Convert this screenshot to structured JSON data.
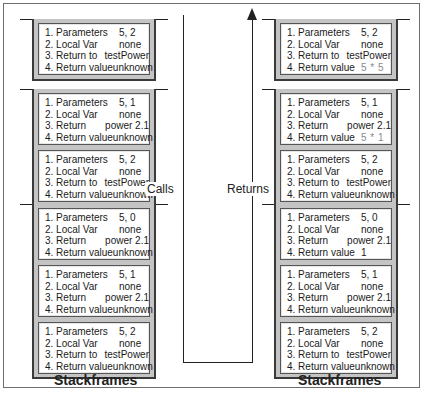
{
  "labels": {
    "calls": "Calls",
    "returns": "Returns",
    "left_title": "Stackframes",
    "right_title": "Stackframes"
  },
  "row_keys": {
    "params": "1. Parameters",
    "local": "2. Local  Var",
    "local_b": "2. Local Var",
    "return_to": "3. Return to",
    "return": "3. Return",
    "return_value": "4. Return value"
  },
  "left": {
    "stacks": [
      {
        "frames": [
          {
            "k": [
              "1. Parameters",
              "2. Local  Var",
              "3. Return to",
              "4. Return value"
            ],
            "v": [
              "5, 2",
              "none",
              "testPower",
              "unknown"
            ]
          }
        ]
      },
      {
        "frames": [
          {
            "k": [
              "1. Parameters",
              "2. Local Var",
              "3. Return",
              "4. Return value"
            ],
            "v": [
              "5, 1",
              "none",
              "power 2.1",
              "unknown"
            ]
          },
          {
            "k": [
              "1. Parameters",
              "2. Local  Var",
              "3. Return to",
              "4. Return value"
            ],
            "v": [
              "5, 2",
              "none",
              "testPower",
              "unknown"
            ]
          }
        ]
      },
      {
        "frames": [
          {
            "k": [
              "1. Parameters",
              "2. Local Var",
              "3. Return",
              "4. Return value"
            ],
            "v": [
              "5, 0",
              "none",
              "power 2.1",
              "unknown"
            ]
          },
          {
            "k": [
              "1. Parameters",
              "2. Local Var",
              "3. Return",
              "4. Return value"
            ],
            "v": [
              "5, 1",
              "none",
              "power 2.1",
              "unknown"
            ]
          },
          {
            "k": [
              "1. Parameters",
              "2. Local  Var",
              "3. Return to",
              "4. Return value"
            ],
            "v": [
              "5, 2",
              "none",
              "testPower",
              "unknown"
            ]
          }
        ]
      }
    ]
  },
  "right": {
    "stacks": [
      {
        "frames": [
          {
            "k": [
              "1. Parameters",
              "2. Local  Var",
              "3. Return to",
              "4. Return value"
            ],
            "v": [
              "5, 2",
              "none",
              "testPower",
              "5 * 5"
            ]
          }
        ]
      },
      {
        "frames": [
          {
            "k": [
              "1. Parameters",
              "2. Local Var",
              "3. Return",
              "4. Return value"
            ],
            "v": [
              "5, 1",
              "none",
              "power 2.1",
              "5 * 1"
            ]
          },
          {
            "k": [
              "1. Parameters",
              "2. Local  Var",
              "3. Return to",
              "4. Return value"
            ],
            "v": [
              "5, 2",
              "none",
              "testPower",
              "unknown"
            ]
          }
        ]
      },
      {
        "frames": [
          {
            "k": [
              "1. Parameters",
              "2. Local Var",
              "3. Return",
              "4. Return value"
            ],
            "v": [
              "5, 0",
              "none",
              "power 2.1",
              "1"
            ]
          },
          {
            "k": [
              "1. Parameters",
              "2. Local Var",
              "3. Return",
              "4. Return value"
            ],
            "v": [
              "5, 1",
              "none",
              "power 2.1",
              "unknown"
            ]
          },
          {
            "k": [
              "1. Parameters",
              "2. Local  Var",
              "3. Return to",
              "4. Return value"
            ],
            "v": [
              "5, 2",
              "none",
              "testPower",
              "unknown"
            ]
          }
        ]
      }
    ]
  },
  "colors": {
    "stack_fill": "#c4c4c4",
    "frame_fill": "#ffffff",
    "line": "#222222",
    "computed_value": "#8a8a8a"
  }
}
